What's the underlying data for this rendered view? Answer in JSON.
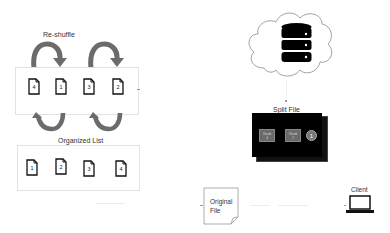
{
  "left": {
    "reshuffle_label": "Re-shuffle",
    "shuffled_docs": [
      "4",
      "1",
      "3",
      "2"
    ],
    "organized_label": "Organized List",
    "organized_docs": [
      "1",
      "2",
      "3",
      "4"
    ]
  },
  "right": {
    "cloud_icon": "cloud-icon",
    "database_icon": "database-icon",
    "split_file_label": "Split File",
    "chunks": [
      {
        "label": "Chunk",
        "number": "4"
      },
      {
        "label": "Chunk",
        "number": "2"
      }
    ],
    "circle_number": "1",
    "original_file_label_line1": "Original",
    "original_file_label_line2": "File",
    "client_label": "Client",
    "client_icon": "laptop-icon"
  },
  "colors": {
    "arrow": "#6b6b6b",
    "split_box": "#000000",
    "chunk_fill": "#6a6a6a",
    "panel_border": "#e2e2e2"
  }
}
